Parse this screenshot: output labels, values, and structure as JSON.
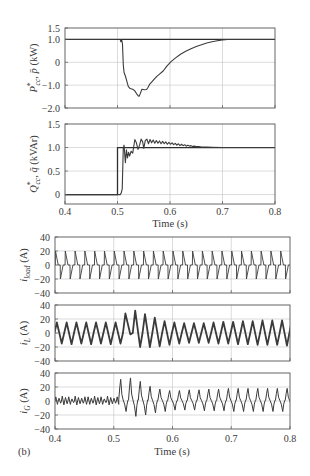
{
  "figure": {
    "panel_label": "(b)",
    "top_xlabel": "Time (s)",
    "bottom_xlabel": "Time (s)"
  },
  "labels": {
    "p_plot": {
      "var": "P",
      "sup": "*",
      "sub": "cc",
      "sep": ", ",
      "var2": "p̄",
      "unit": " (kW)"
    },
    "q_plot": {
      "var": "Q",
      "sup": "*",
      "sub": "cc",
      "sep": ", ",
      "var2": "q̄",
      "unit": " (kVAr)"
    },
    "iload_plot": {
      "var": "i",
      "sub": "load",
      "unit": " (A)"
    },
    "iL_plot": {
      "var": "i",
      "sub": "L",
      "unit": " (A)"
    },
    "iG_plot": {
      "var": "i",
      "sub": "G",
      "unit": " (A)"
    }
  },
  "chart_data": [
    {
      "id": "p_plot",
      "type": "line",
      "title": "",
      "xlabel": "",
      "ylabel": "P*cc, p̄ (kW)",
      "xlim": [
        0.4,
        0.8
      ],
      "ylim": [
        -2.0,
        1.5
      ],
      "grid": true,
      "show_xticks": false,
      "xticks": [
        {
          "v": 0.4,
          "label": "0.4"
        },
        {
          "v": 0.5,
          "label": "0.5"
        },
        {
          "v": 0.6,
          "label": "0.6"
        },
        {
          "v": 0.7,
          "label": "0.7"
        },
        {
          "v": 0.8,
          "label": "0.8"
        }
      ],
      "yticks": [
        {
          "v": 1.5,
          "label": "1.5"
        },
        {
          "v": 1.0,
          "label": "1.0"
        },
        {
          "v": 0,
          "label": "0"
        },
        {
          "v": -1.0,
          "label": "−1.0"
        },
        {
          "v": -2.0,
          "label": "−2.0"
        }
      ],
      "series": [
        {
          "name": "P*cc (reference)",
          "ref": true,
          "points": [
            [
              0.4,
              1.0
            ],
            [
              0.8,
              1.0
            ]
          ]
        },
        {
          "name": "p̄ (measured)",
          "points": [
            [
              0.4,
              1.0
            ],
            [
              0.505,
              1.0
            ],
            [
              0.5065,
              0.9
            ],
            [
              0.508,
              0.98
            ],
            [
              0.5095,
              0.8
            ],
            [
              0.511,
              -0.1
            ],
            [
              0.5125,
              -0.45
            ],
            [
              0.515,
              -0.6
            ],
            [
              0.518,
              -0.85
            ],
            [
              0.5205,
              -1.05
            ],
            [
              0.524,
              -1.15
            ],
            [
              0.529,
              -1.18
            ],
            [
              0.533,
              -1.25
            ],
            [
              0.5365,
              -1.38
            ],
            [
              0.5395,
              -1.47
            ],
            [
              0.5415,
              -1.48
            ],
            [
              0.5435,
              -1.36
            ],
            [
              0.5465,
              -1.18
            ],
            [
              0.551,
              -1.2
            ],
            [
              0.5555,
              -1.19
            ],
            [
              0.558,
              -1.1
            ],
            [
              0.561,
              -0.97
            ],
            [
              0.565,
              -0.87
            ],
            [
              0.57,
              -0.74
            ],
            [
              0.575,
              -0.62
            ],
            [
              0.58,
              -0.52
            ],
            [
              0.587,
              -0.38
            ],
            [
              0.594,
              -0.17
            ],
            [
              0.602,
              0.03
            ],
            [
              0.61,
              0.18
            ],
            [
              0.62,
              0.35
            ],
            [
              0.63,
              0.48
            ],
            [
              0.64,
              0.59
            ],
            [
              0.65,
              0.69
            ],
            [
              0.66,
              0.77
            ],
            [
              0.67,
              0.84
            ],
            [
              0.68,
              0.9
            ],
            [
              0.69,
              0.94
            ],
            [
              0.7,
              0.98
            ],
            [
              0.71,
              1.0
            ],
            [
              0.8,
              1.0
            ]
          ]
        }
      ]
    },
    {
      "id": "q_plot",
      "type": "line",
      "title": "",
      "xlabel": "Time (s)",
      "ylabel": "Q*cc, q̄ (kVAr)",
      "xlim": [
        0.4,
        0.8
      ],
      "ylim": [
        -0.2,
        1.5
      ],
      "grid": true,
      "show_xticks": true,
      "xticks": [
        {
          "v": 0.4,
          "label": "0.4"
        },
        {
          "v": 0.5,
          "label": "0.5"
        },
        {
          "v": 0.6,
          "label": "0.6"
        },
        {
          "v": 0.7,
          "label": "0.7"
        },
        {
          "v": 0.8,
          "label": "0.8"
        }
      ],
      "yticks": [
        {
          "v": 1.5,
          "label": "1.5"
        },
        {
          "v": 1.0,
          "label": "1.0"
        },
        {
          "v": 0.5,
          "label": "0.5"
        },
        {
          "v": 0,
          "label": "0"
        }
      ],
      "series": [
        {
          "name": "Q*cc (reference)",
          "ref": true,
          "points": [
            [
              0.4,
              0
            ],
            [
              0.5,
              0
            ],
            [
              0.5,
              1.0
            ],
            [
              0.8,
              1.0
            ]
          ]
        },
        {
          "name": "q̄ (measured)",
          "points": [
            [
              0.4,
              0
            ],
            [
              0.505,
              0
            ],
            [
              0.507,
              0.03
            ],
            [
              0.509,
              0.12
            ],
            [
              0.511,
              0.98
            ],
            [
              0.5125,
              1.05
            ],
            [
              0.515,
              0.68
            ],
            [
              0.517,
              0.95
            ],
            [
              0.519,
              0.78
            ],
            [
              0.521,
              0.9
            ],
            [
              0.523,
              0.82
            ],
            [
              0.526,
              0.92
            ],
            [
              0.529,
              0.88
            ],
            [
              0.533,
              1.17
            ],
            [
              0.536,
              1.1
            ],
            [
              0.539,
              0.96
            ],
            [
              0.542,
              1.05
            ],
            [
              0.545,
              1.18
            ],
            [
              0.548,
              1.12
            ],
            [
              0.55,
              0.98
            ],
            [
              0.553,
              1.15
            ],
            [
              0.556,
              1.18
            ],
            [
              0.559,
              1.08
            ],
            [
              0.562,
              1.17
            ],
            [
              0.565,
              1.1
            ],
            [
              0.568,
              1.16
            ],
            [
              0.571,
              1.09
            ],
            [
              0.574,
              1.15
            ],
            [
              0.577,
              1.09
            ],
            [
              0.58,
              1.14
            ],
            [
              0.583,
              1.08
            ],
            [
              0.586,
              1.13
            ],
            [
              0.589,
              1.08
            ],
            [
              0.592,
              1.12
            ],
            [
              0.595,
              1.07
            ],
            [
              0.598,
              1.11
            ],
            [
              0.601,
              1.07
            ],
            [
              0.604,
              1.1
            ],
            [
              0.607,
              1.06
            ],
            [
              0.61,
              1.09
            ],
            [
              0.613,
              1.05
            ],
            [
              0.616,
              1.08
            ],
            [
              0.619,
              1.04
            ],
            [
              0.622,
              1.07
            ],
            [
              0.625,
              1.04
            ],
            [
              0.628,
              1.06
            ],
            [
              0.631,
              1.03
            ],
            [
              0.634,
              1.05
            ],
            [
              0.637,
              1.03
            ],
            [
              0.64,
              1.04
            ],
            [
              0.643,
              1.02
            ],
            [
              0.646,
              1.03
            ],
            [
              0.65,
              1.02
            ],
            [
              0.655,
              1.02
            ],
            [
              0.66,
              1.01
            ],
            [
              0.67,
              1.01
            ],
            [
              0.68,
              1.005
            ],
            [
              0.7,
              1.0
            ],
            [
              0.8,
              1.0
            ]
          ]
        }
      ]
    },
    {
      "id": "iload_plot",
      "type": "line",
      "title": "",
      "xlabel": "",
      "ylabel": "i_load (A)",
      "xlim": [
        0.4,
        0.8
      ],
      "ylim": [
        -40,
        40
      ],
      "grid": true,
      "show_xticks": false,
      "xticks": [
        {
          "v": 0.4,
          "label": "0.4"
        },
        {
          "v": 0.5,
          "label": "0.5"
        },
        {
          "v": 0.6,
          "label": "0.6"
        },
        {
          "v": 0.7,
          "label": "0.7"
        },
        {
          "v": 0.8,
          "label": "0.8"
        }
      ],
      "yticks": [
        {
          "v": 40,
          "label": "40"
        },
        {
          "v": 20,
          "label": "20"
        },
        {
          "v": 0,
          "label": "0"
        },
        {
          "v": -20,
          "label": "−20"
        },
        {
          "v": -40,
          "label": "−40"
        }
      ],
      "series": [
        {
          "name": "i_load",
          "waveform": {
            "t_start": 0.4005,
            "period_s": 0.016667,
            "cycles": 24,
            "peaks": 20,
            "troughs": -20,
            "shape": [
              [
                0,
                0
              ],
              [
                0.02,
                1
              ],
              [
                0.3,
                0
              ],
              [
                0.5,
                0
              ],
              [
                0.52,
                -1
              ],
              [
                0.8,
                0
              ],
              [
                1,
                0
              ]
            ]
          }
        }
      ]
    },
    {
      "id": "iL_plot",
      "type": "line",
      "title": "",
      "xlabel": "",
      "ylabel": "i_L (A)",
      "xlim": [
        0.4,
        0.8
      ],
      "ylim": [
        -40,
        40
      ],
      "grid": true,
      "show_xticks": false,
      "xticks": [
        {
          "v": 0.4,
          "label": "0.4"
        },
        {
          "v": 0.5,
          "label": "0.5"
        },
        {
          "v": 0.6,
          "label": "0.6"
        },
        {
          "v": 0.7,
          "label": "0.7"
        },
        {
          "v": 0.8,
          "label": "0.8"
        }
      ],
      "yticks": [
        {
          "v": 40,
          "label": "40"
        },
        {
          "v": 20,
          "label": "20"
        },
        {
          "v": 0,
          "label": "0"
        },
        {
          "v": -20,
          "label": "−20"
        },
        {
          "v": -40,
          "label": "−40"
        }
      ],
      "series": [
        {
          "name": "i_L",
          "waveform": {
            "t_start": 0.399,
            "period_s": 0.016667,
            "cycles": 25,
            "peaks": [
              15,
              15,
              15,
              15,
              15,
              15,
              15,
              28,
              32,
              27,
              22,
              17,
              15,
              14,
              14,
              14,
              15,
              16,
              16,
              17,
              17,
              18,
              18,
              18,
              18
            ],
            "troughs": [
              -15,
              -16,
              -15,
              -16,
              -15,
              -16,
              -15,
              -2,
              -20,
              -20,
              -19,
              -17,
              -15,
              -14,
              -14,
              -14,
              -15,
              -15,
              -16,
              -16,
              -17,
              -17,
              -17,
              -18,
              -18
            ],
            "shape": [
              [
                0,
                0
              ],
              [
                0.25,
                1
              ],
              [
                0.75,
                -1
              ],
              [
                1,
                0
              ]
            ]
          }
        }
      ]
    },
    {
      "id": "iG_plot",
      "type": "line",
      "title": "",
      "xlabel": "Time (s)",
      "ylabel": "i_G (A)",
      "xlim": [
        0.4,
        0.8
      ],
      "ylim": [
        -40,
        40
      ],
      "grid": true,
      "show_xticks": true,
      "xticks": [
        {
          "v": 0.4,
          "label": "0.4"
        },
        {
          "v": 0.5,
          "label": "0.5"
        },
        {
          "v": 0.6,
          "label": "0.6"
        },
        {
          "v": 0.7,
          "label": "0.7"
        },
        {
          "v": 0.8,
          "label": "0.8"
        }
      ],
      "yticks": [
        {
          "v": 40,
          "label": "40"
        },
        {
          "v": 20,
          "label": "20"
        },
        {
          "v": 0,
          "label": "0"
        },
        {
          "v": -20,
          "label": "−20"
        },
        {
          "v": -40,
          "label": "−40"
        }
      ],
      "series": [
        {
          "name": "i_G",
          "pre_ripple": {
            "t_start": 0.4,
            "t_end": 0.5085,
            "period_s": 0.0055,
            "amplitudes": [
              6,
              4,
              7,
              5,
              6,
              3,
              7,
              5,
              4,
              6
            ]
          },
          "waveform": {
            "t_start": 0.5085,
            "period_s": 0.016667,
            "cycles": 18,
            "peaks": [
              31,
              33,
              28,
              21,
              17,
              15,
              15,
              16,
              16,
              17,
              17,
              18,
              18,
              18,
              18,
              18,
              18,
              18
            ],
            "troughs": [
              -15,
              -22,
              -20,
              -17,
              -15,
              -13,
              -13,
              -13,
              -14,
              -14,
              -14,
              -15,
              -15,
              -15,
              -15,
              -15,
              -15,
              -15
            ],
            "shape": [
              [
                0,
                0.05
              ],
              [
                0.1,
                0.6
              ],
              [
                0.2,
                1
              ],
              [
                0.32,
                0.3
              ],
              [
                0.45,
                0.05
              ],
              [
                0.6,
                -0.3
              ],
              [
                0.75,
                -1
              ],
              [
                0.85,
                -0.3
              ],
              [
                0.95,
                0.05
              ],
              [
                1,
                0.05
              ]
            ]
          }
        }
      ]
    }
  ]
}
